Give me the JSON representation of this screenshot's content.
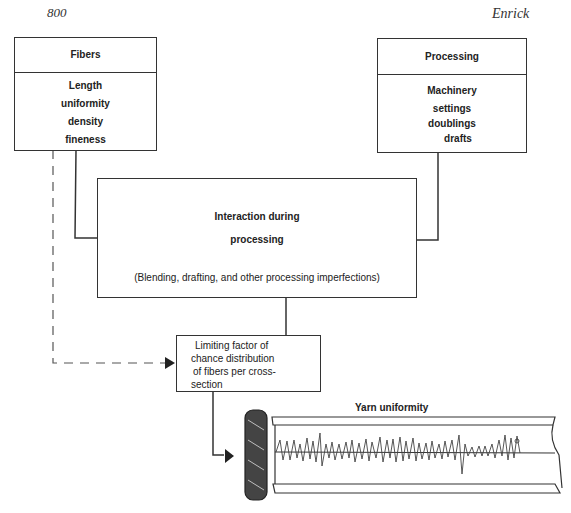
{
  "header": {
    "page_number": "800",
    "author": "Enrick"
  },
  "diagram": {
    "fibers_box": {
      "title": "Fibers",
      "items": [
        "Length",
        "uniformity",
        "density",
        "fineness"
      ]
    },
    "processing_box": {
      "title": "Processing",
      "items": [
        "Machinery",
        "settings",
        "doublings",
        "drafts"
      ]
    },
    "interaction_box": {
      "line1": "Interaction during",
      "line2": "processing",
      "note": "(Blending, drafting, and other processing imperfections)"
    },
    "limiting_box": {
      "lines": [
        "Limiting factor of",
        "chance distribution",
        "of fibers per cross-",
        "section"
      ]
    },
    "yarn": {
      "label": "Yarn uniformity"
    }
  }
}
